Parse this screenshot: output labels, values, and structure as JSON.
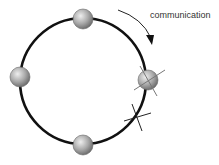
{
  "diagram": {
    "type": "ring-communication",
    "annotation_label": "communication",
    "ring": {
      "cx": 83,
      "cy": 81,
      "r": 63,
      "color": "#111111"
    },
    "nodes": [
      {
        "name": "node-top",
        "cx": 83,
        "cy": 19,
        "state": "active"
      },
      {
        "name": "node-left",
        "cx": 20,
        "cy": 77,
        "state": "active"
      },
      {
        "name": "node-bottom",
        "cx": 83,
        "cy": 145,
        "state": "active"
      },
      {
        "name": "node-right",
        "cx": 148,
        "cy": 80,
        "state": "failed"
      }
    ],
    "link_break": {
      "cx": 137,
      "cy": 117
    },
    "arrow_direction": "clockwise",
    "colors": {
      "node_fill": "#a8a8a8",
      "cross": "#666666",
      "ring": "#111111"
    }
  }
}
